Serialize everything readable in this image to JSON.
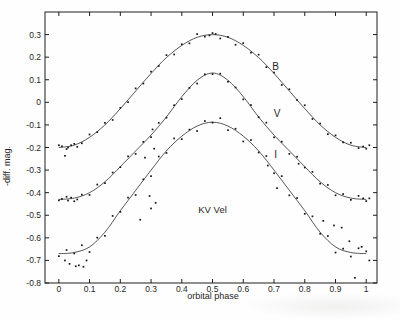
{
  "page": {
    "background": "#fefefe",
    "ink": "#1e1e1e"
  },
  "chart_data": {
    "type": "scatter",
    "title": "KV Vel",
    "xlabel": "orbital phase",
    "ylabel": "-diff. mag.",
    "xlim": [
      -0.045,
      1.035
    ],
    "ylim": [
      -0.8,
      0.4
    ],
    "grid": false,
    "frame": true,
    "legend_position": "inline-labels",
    "ink_color": "#1e1e1e",
    "x_ticks": {
      "values": [
        0,
        0.1,
        0.2,
        0.3,
        0.4,
        0.5,
        0.6,
        0.7,
        0.8,
        0.9,
        1
      ],
      "labels": [
        "0",
        "0.1",
        "0.2",
        "0.3",
        "0.4",
        "0.5",
        "0.6",
        "0.7",
        "0.8",
        "0.9",
        "1"
      ]
    },
    "y_ticks": {
      "values": [
        0.3,
        0.2,
        0.1,
        0,
        -0.1,
        -0.2,
        -0.3,
        -0.4,
        -0.5,
        -0.6,
        -0.7,
        -0.8
      ],
      "labels": [
        "0.3",
        "0.2",
        "0.1",
        "0",
        "-0.1",
        "-0.2",
        "-0.3",
        "-0.4",
        "-0.5",
        "-0.6",
        "-0.7",
        "-0.8"
      ]
    },
    "annotations": [
      {
        "text": "KV Vel",
        "x": 0.5,
        "y": -0.49
      }
    ],
    "series": [
      {
        "name": "B",
        "label": {
          "text": "B",
          "x": 0.705,
          "y": 0.145
        },
        "curve": [
          [
            0.0,
            -0.2
          ],
          [
            0.05,
            -0.19
          ],
          [
            0.1,
            -0.155
          ],
          [
            0.15,
            -0.1
          ],
          [
            0.2,
            -0.028
          ],
          [
            0.25,
            0.05
          ],
          [
            0.3,
            0.128
          ],
          [
            0.35,
            0.198
          ],
          [
            0.4,
            0.252
          ],
          [
            0.45,
            0.288
          ],
          [
            0.5,
            0.3
          ],
          [
            0.55,
            0.288
          ],
          [
            0.6,
            0.252
          ],
          [
            0.65,
            0.198
          ],
          [
            0.7,
            0.128
          ],
          [
            0.75,
            0.05
          ],
          [
            0.8,
            -0.028
          ],
          [
            0.85,
            -0.1
          ],
          [
            0.9,
            -0.155
          ],
          [
            0.95,
            -0.19
          ],
          [
            1.0,
            -0.2
          ]
        ],
        "points": [
          [
            0.0,
            -0.19
          ],
          [
            0.01,
            -0.195
          ],
          [
            0.02,
            -0.237
          ],
          [
            0.025,
            -0.207
          ],
          [
            0.03,
            -0.2
          ],
          [
            0.04,
            -0.19
          ],
          [
            0.05,
            -0.184
          ],
          [
            0.06,
            -0.197
          ],
          [
            0.075,
            -0.181
          ],
          [
            0.1,
            -0.142
          ],
          [
            0.125,
            -0.132
          ],
          [
            0.15,
            -0.091
          ],
          [
            0.175,
            -0.078
          ],
          [
            0.2,
            -0.025
          ],
          [
            0.225,
            0.001
          ],
          [
            0.25,
            0.062
          ],
          [
            0.275,
            0.083
          ],
          [
            0.3,
            0.136
          ],
          [
            0.325,
            0.161
          ],
          [
            0.35,
            0.209
          ],
          [
            0.375,
            0.212
          ],
          [
            0.4,
            0.257
          ],
          [
            0.425,
            0.261
          ],
          [
            0.45,
            0.302
          ],
          [
            0.475,
            0.291
          ],
          [
            0.49,
            0.296
          ],
          [
            0.5,
            0.307
          ],
          [
            0.51,
            0.303
          ],
          [
            0.525,
            0.283
          ],
          [
            0.55,
            0.29
          ],
          [
            0.575,
            0.255
          ],
          [
            0.6,
            0.262
          ],
          [
            0.625,
            0.22
          ],
          [
            0.65,
            0.211
          ],
          [
            0.675,
            0.156
          ],
          [
            0.7,
            0.132
          ],
          [
            0.725,
            0.077
          ],
          [
            0.75,
            0.058
          ],
          [
            0.775,
            0.01
          ],
          [
            0.8,
            -0.013
          ],
          [
            0.825,
            -0.074
          ],
          [
            0.85,
            -0.094
          ],
          [
            0.875,
            -0.141
          ],
          [
            0.9,
            -0.146
          ],
          [
            0.925,
            -0.177
          ],
          [
            0.95,
            -0.179
          ],
          [
            0.975,
            -0.203
          ],
          [
            0.99,
            -0.196
          ],
          [
            1.0,
            -0.205
          ],
          [
            1.01,
            -0.19
          ]
        ]
      },
      {
        "name": "V",
        "label": {
          "text": "V",
          "x": 0.71,
          "y": -0.065
        },
        "curve": [
          [
            0.0,
            -0.43
          ],
          [
            0.05,
            -0.424
          ],
          [
            0.1,
            -0.4
          ],
          [
            0.15,
            -0.352
          ],
          [
            0.2,
            -0.285
          ],
          [
            0.25,
            -0.215
          ],
          [
            0.3,
            -0.145
          ],
          [
            0.35,
            -0.065
          ],
          [
            0.4,
            0.025
          ],
          [
            0.45,
            0.098
          ],
          [
            0.5,
            0.13
          ],
          [
            0.55,
            0.098
          ],
          [
            0.6,
            0.025
          ],
          [
            0.65,
            -0.065
          ],
          [
            0.7,
            -0.145
          ],
          [
            0.75,
            -0.215
          ],
          [
            0.8,
            -0.285
          ],
          [
            0.85,
            -0.352
          ],
          [
            0.9,
            -0.4
          ],
          [
            0.95,
            -0.424
          ],
          [
            1.0,
            -0.43
          ]
        ],
        "points": [
          [
            0.0,
            -0.434
          ],
          [
            0.01,
            -0.428
          ],
          [
            0.025,
            -0.418
          ],
          [
            0.03,
            -0.435
          ],
          [
            0.04,
            -0.422
          ],
          [
            0.05,
            -0.438
          ],
          [
            0.06,
            -0.43
          ],
          [
            0.075,
            -0.409
          ],
          [
            0.1,
            -0.41
          ],
          [
            0.125,
            -0.364
          ],
          [
            0.15,
            -0.358
          ],
          [
            0.175,
            -0.311
          ],
          [
            0.2,
            -0.287
          ],
          [
            0.225,
            -0.239
          ],
          [
            0.25,
            -0.228
          ],
          [
            0.275,
            -0.175
          ],
          [
            0.3,
            -0.154
          ],
          [
            0.305,
            -0.12
          ],
          [
            0.325,
            -0.091
          ],
          [
            0.35,
            -0.068
          ],
          [
            0.375,
            -0.013
          ],
          [
            0.4,
            0.014
          ],
          [
            0.425,
            0.064
          ],
          [
            0.45,
            0.083
          ],
          [
            0.475,
            0.124
          ],
          [
            0.5,
            0.125
          ],
          [
            0.525,
            0.127
          ],
          [
            0.55,
            0.091
          ],
          [
            0.575,
            0.066
          ],
          [
            0.6,
            0.013
          ],
          [
            0.625,
            -0.012
          ],
          [
            0.65,
            -0.066
          ],
          [
            0.675,
            -0.09
          ],
          [
            0.7,
            -0.155
          ],
          [
            0.725,
            -0.174
          ],
          [
            0.75,
            -0.228
          ],
          [
            0.775,
            -0.241
          ],
          [
            0.78,
            -0.272
          ],
          [
            0.8,
            -0.289
          ],
          [
            0.825,
            -0.308
          ],
          [
            0.85,
            -0.36
          ],
          [
            0.875,
            -0.366
          ],
          [
            0.9,
            -0.412
          ],
          [
            0.925,
            -0.406
          ],
          [
            0.95,
            -0.432
          ],
          [
            0.975,
            -0.414
          ],
          [
            0.99,
            -0.425
          ],
          [
            1.0,
            -0.437
          ],
          [
            1.01,
            -0.425
          ]
        ]
      },
      {
        "name": "I",
        "label": {
          "text": "I",
          "x": 0.705,
          "y": -0.245
        },
        "curve": [
          [
            0.0,
            -0.67
          ],
          [
            0.05,
            -0.665
          ],
          [
            0.1,
            -0.64
          ],
          [
            0.15,
            -0.575
          ],
          [
            0.2,
            -0.48
          ],
          [
            0.25,
            -0.39
          ],
          [
            0.3,
            -0.3
          ],
          [
            0.35,
            -0.215
          ],
          [
            0.4,
            -0.15
          ],
          [
            0.45,
            -0.105
          ],
          [
            0.5,
            -0.088
          ],
          [
            0.55,
            -0.105
          ],
          [
            0.6,
            -0.15
          ],
          [
            0.65,
            -0.215
          ],
          [
            0.7,
            -0.3
          ],
          [
            0.75,
            -0.39
          ],
          [
            0.8,
            -0.48
          ],
          [
            0.85,
            -0.575
          ],
          [
            0.9,
            -0.64
          ],
          [
            0.95,
            -0.665
          ],
          [
            1.0,
            -0.67
          ]
        ],
        "points": [
          [
            0.0,
            -0.681
          ],
          [
            0.02,
            -0.7
          ],
          [
            0.025,
            -0.654
          ],
          [
            0.035,
            -0.715
          ],
          [
            0.05,
            -0.669
          ],
          [
            0.055,
            -0.726
          ],
          [
            0.065,
            -0.722
          ],
          [
            0.075,
            -0.633
          ],
          [
            0.08,
            -0.728
          ],
          [
            0.09,
            -0.7
          ],
          [
            0.1,
            -0.663
          ],
          [
            0.125,
            -0.599
          ],
          [
            0.15,
            -0.591
          ],
          [
            0.175,
            -0.503
          ],
          [
            0.2,
            -0.485
          ],
          [
            0.225,
            -0.422
          ],
          [
            0.25,
            -0.41
          ],
          [
            0.265,
            -0.52
          ],
          [
            0.275,
            -0.341
          ],
          [
            0.28,
            -0.245
          ],
          [
            0.295,
            -0.415
          ],
          [
            0.3,
            -0.47
          ],
          [
            0.3,
            -0.327
          ],
          [
            0.31,
            -0.205
          ],
          [
            0.315,
            -0.445
          ],
          [
            0.325,
            -0.24
          ],
          [
            0.35,
            -0.224
          ],
          [
            0.375,
            -0.16
          ],
          [
            0.4,
            -0.163
          ],
          [
            0.425,
            -0.121
          ],
          [
            0.45,
            -0.127
          ],
          [
            0.475,
            -0.083
          ],
          [
            0.5,
            -0.09
          ],
          [
            0.525,
            -0.07
          ],
          [
            0.55,
            -0.123
          ],
          [
            0.575,
            -0.117
          ],
          [
            0.6,
            -0.173
          ],
          [
            0.625,
            -0.167
          ],
          [
            0.65,
            -0.222
          ],
          [
            0.675,
            -0.238
          ],
          [
            0.68,
            -0.28
          ],
          [
            0.7,
            -0.314
          ],
          [
            0.71,
            -0.38
          ],
          [
            0.725,
            -0.327
          ],
          [
            0.75,
            -0.412
          ],
          [
            0.775,
            -0.424
          ],
          [
            0.8,
            -0.494
          ],
          [
            0.825,
            -0.505
          ],
          [
            0.85,
            -0.582
          ],
          [
            0.86,
            -0.525
          ],
          [
            0.875,
            -0.592
          ],
          [
            0.895,
            -0.545
          ],
          [
            0.9,
            -0.665
          ],
          [
            0.92,
            -0.555
          ],
          [
            0.925,
            -0.648
          ],
          [
            0.945,
            -0.615
          ],
          [
            0.95,
            -0.683
          ],
          [
            0.963,
            -0.777
          ],
          [
            0.975,
            -0.646
          ],
          [
            0.985,
            -0.64
          ],
          [
            1.0,
            -0.66
          ],
          [
            1.01,
            -0.7
          ]
        ]
      }
    ]
  }
}
